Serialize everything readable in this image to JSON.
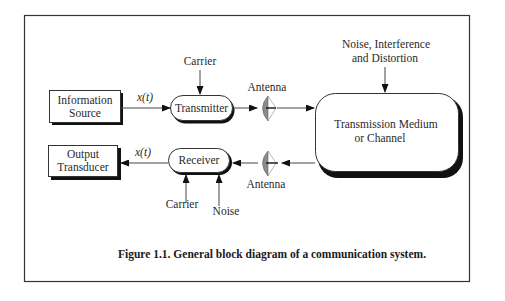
{
  "figure": {
    "caption": "Figure 1.1. General block diagram of a communication system."
  },
  "blocks": {
    "information_source": {
      "line1": "Information",
      "line2": "Source"
    },
    "transmitter": {
      "label": "Transmitter"
    },
    "channel": {
      "line1": "Transmission Medium",
      "line2": "or Channel"
    },
    "receiver": {
      "label": "Receiver"
    },
    "output_transducer": {
      "line1": "Output",
      "line2": "Transducer"
    }
  },
  "labels": {
    "carrier_tx": "Carrier",
    "carrier_rx": "Carrier",
    "noise_rx": "Noise",
    "noise_channel_line1": "Noise, Interference",
    "noise_channel_line2": "and Distortion",
    "antenna_tx": "Antenna",
    "antenna_rx": "Antenna",
    "signal_tx": "x(t)",
    "signal_rx": "x(t)"
  },
  "colors": {
    "stroke": "#222222",
    "shadow": "#111111",
    "antenna_fill": "#8a8a8a",
    "background": "#ffffff"
  }
}
